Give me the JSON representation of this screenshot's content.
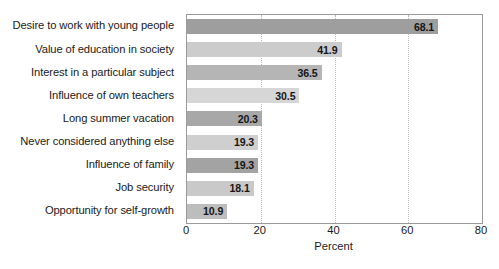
{
  "chart_data": {
    "type": "bar",
    "orientation": "horizontal",
    "title": "",
    "xlabel": "Percent",
    "ylabel": "",
    "xlim": [
      0,
      80
    ],
    "xticks": [
      0,
      20,
      40,
      60,
      80
    ],
    "grid": true,
    "grid_axis": "x",
    "grid_style": "dotted",
    "legend": false,
    "categories": [
      "Desire to work with young people",
      "Value of education in society",
      "Interest in a particular subject",
      "Influence of own teachers",
      "Long summer vacation",
      "Never considered anything else",
      "Influence of family",
      "Job security",
      "Opportunity for self-growth"
    ],
    "values": [
      68.1,
      41.9,
      36.5,
      30.5,
      20.3,
      19.3,
      19.3,
      18.1,
      10.9
    ],
    "value_labels": [
      "68.1",
      "41.9",
      "36.5",
      "30.5",
      "20.3",
      "19.3",
      "19.3",
      "18.1",
      "10.9"
    ],
    "bar_colors": [
      "#9e9e9e",
      "#cccccc",
      "#b5b5b5",
      "#d6d6d6",
      "#a8a8a8",
      "#cfcfcf",
      "#a3a3a3",
      "#c9c9c9",
      "#bdbdbd"
    ],
    "label_position": "inside-end"
  },
  "style": {
    "plot_border_color": "#9a9a9a",
    "gridline_color": "#b9b9b9",
    "background": "#ffffff",
    "text_color": "#1a1a1a"
  }
}
